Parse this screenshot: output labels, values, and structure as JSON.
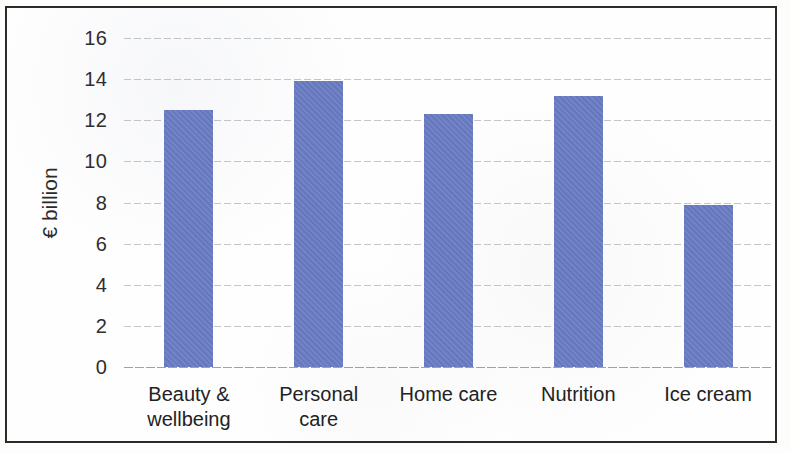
{
  "chart_data": {
    "type": "bar",
    "title": "",
    "subtitle": "",
    "xlabel": "",
    "ylabel": "€ billion",
    "categories": [
      "Beauty & wellbeing",
      "Personal care",
      "Home care",
      "Nutrition",
      "Ice cream"
    ],
    "values": [
      12.5,
      13.9,
      12.3,
      13.2,
      7.9
    ],
    "ylim": [
      0,
      16
    ],
    "ytick_labels": [
      "16",
      "14",
      "12",
      "10",
      "8",
      "6",
      "4",
      "2",
      "0"
    ],
    "ytick_values": [
      16,
      14,
      12,
      10,
      8,
      6,
      4,
      2,
      0
    ],
    "grid": true,
    "legend": "none",
    "bar_color": "#6b7cc4",
    "frame_color": "#2b2b2b",
    "gridline_color": "#969aa2",
    "background": "#fefefe"
  },
  "axis": {
    "y_title": "€ billion"
  },
  "categories_display": [
    {
      "line1": "Beauty &",
      "line2": "wellbeing"
    },
    {
      "line1": "Personal",
      "line2": "care"
    },
    {
      "line1": "Home care",
      "line2": ""
    },
    {
      "line1": "Nutrition",
      "line2": ""
    },
    {
      "line1": "Ice cream",
      "line2": ""
    }
  ]
}
